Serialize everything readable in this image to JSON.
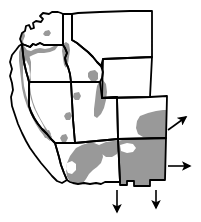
{
  "figure": {
    "type": "distribution-range-map",
    "region": "Western United States",
    "title": "",
    "background_color": "#ffffff",
    "outline_color": "#000000",
    "range_fill_color": "#999999",
    "state_fill_color": "#ffffff",
    "arrow_color": "#000000",
    "arrow_meaning": "range continues beyond map edge"
  },
  "map": {
    "states": [
      {
        "name": "Washington",
        "abbr": "WA",
        "path": "M 20 39 L 22 33 L 25 31 L 26 26 L 29 25 L 31 29 L 34 28 L 33 23 L 36 21 L 41 22 L 43 19 L 40 16 L 43 13 L 49 14 L 52 12 L 58 12 L 61 13 L 63 14 L 63 45 L 44 45 L 40 43 L 36 45 L 33 44 L 30 47 L 25 45 L 22 44 Z"
      },
      {
        "name": "Oregon",
        "abbr": "OR",
        "path": "M 22 44 L 25 45 L 30 47 L 33 44 L 36 45 L 40 43 L 44 45 L 63 45 L 65 48 L 67 53 L 65 58 L 66 63 L 68 67 L 70 74 L 71 82 L 29 82 L 28 78 L 26 71 L 24 62 L 23 54 Z"
      },
      {
        "name": "Idaho",
        "abbr": "ID",
        "path": "M 63 14 L 72 14 L 72 40 L 77 43 L 83 48 L 88 52 L 93 57 L 97 62 L 101 66 L 103 72 L 102 78 L 100 82 L 71 82 L 70 74 L 68 67 L 66 63 L 65 58 L 67 53 L 65 48 L 63 45 Z"
      },
      {
        "name": "Montana",
        "abbr": "MT",
        "path": "M 72 14 L 78 13 L 100 12 L 130 11 L 152 11 L 152 57 L 103 59 L 101 66 L 97 62 L 93 57 L 88 52 L 83 48 L 77 43 L 72 40 Z"
      },
      {
        "name": "Wyoming",
        "abbr": "WY",
        "path": "M 103 59 L 152 57 L 150 97 L 102 98 Z"
      },
      {
        "name": "Nevada",
        "abbr": "NV",
        "path": "M 29 82 L 71 82 L 73 119 L 75 143 L 55 143 L 51 139 L 47 134 L 42 129 L 38 124 L 34 118 L 31 112 L 29 106 Z"
      },
      {
        "name": "Utah",
        "abbr": "UT",
        "path": "M 71 82 L 100 82 L 102 98 L 117 97 L 118 139 L 75 143 L 73 119 Z"
      },
      {
        "name": "Colorado",
        "abbr": "CO",
        "path": "M 102 98 L 150 97 L 167 96 L 166 138 L 118 139 L 117 97 Z"
      },
      {
        "name": "California",
        "abbr": "CA",
        "path": "M 22 44 L 23 54 L 24 62 L 26 71 L 28 78 L 29 82 L 29 106 L 31 112 L 34 118 L 38 124 L 42 129 L 47 134 L 51 139 L 55 143 L 57 150 L 59 157 L 61 165 L 64 173 L 67 180 L 62 183 L 57 181 L 52 176 L 47 170 L 41 163 L 35 155 L 30 148 L 26 141 L 22 133 L 18 124 L 15 115 L 12 106 L 11 97 L 13 90 L 12 83 L 10 76 L 12 69 L 10 62 L 12 55 L 16 50 L 19 46 Z"
      },
      {
        "name": "Arizona",
        "abbr": "AZ",
        "path": "M 75 143 L 118 139 L 120 182 L 105 182 L 101 184 L 96 183 L 90 184 L 84 183 L 78 184 L 73 183 L 70 182 L 67 180 L 64 173 L 61 165 L 59 157 L 57 150 L 55 143 Z"
      },
      {
        "name": "New Mexico",
        "abbr": "NM",
        "path": "M 118 139 L 166 138 L 165 180 L 150 180 L 150 186 L 134 186 L 134 181 L 127 181 L 127 185 L 120 185 L 120 182 Z"
      }
    ],
    "range_polygons": [
      {
        "label": "washington-coast-range",
        "path": "M 20 39 L 22 34 L 24 32 L 25 36 L 23 41 L 24 46 L 27 50 L 31 51 L 35 49 L 40 48 L 45 49 L 50 48 L 54 46 L 57 44 L 58 46 L 55 50 L 50 52 L 44 53 L 38 53 L 33 55 L 29 57 L 26 55 L 23 51 L 21 46 Z"
      },
      {
        "label": "washington-cascade-spot",
        "path": "M 45 31 L 49 30 L 51 33 L 49 36 L 45 36 L 43 34 Z"
      },
      {
        "label": "oregon-coast-cascade-range",
        "path": "M 23 53 L 26 55 L 29 57 L 30 62 L 29 68 L 30 74 L 31 80 L 30 86 L 28 92 L 27 98 L 25 95 L 24 88 L 23 80 L 23 72 L 22 64 Z"
      },
      {
        "label": "idaho-panhandle-range",
        "path": "M 63 44 L 66 42 L 69 44 L 70 50 L 69 57 L 68 64 L 66 68 L 64 65 L 63 58 L 62 51 Z"
      },
      {
        "label": "idaho-southeast-spot",
        "path": "M 90 71 L 95 70 L 98 73 L 98 79 L 95 82 L 91 81 L 88 77 L 88 73 Z"
      },
      {
        "label": "utah-wasatch-range",
        "path": "M 99 82 L 103 80 L 106 84 L 107 92 L 106 100 L 104 108 L 101 114 L 97 118 L 94 116 L 94 109 L 95 101 L 96 92 L 97 86 Z"
      },
      {
        "label": "nevada-spot-north",
        "path": "M 74 93 L 79 92 L 81 96 L 79 100 L 75 100 L 73 97 Z"
      },
      {
        "label": "nevada-spot-central",
        "path": "M 66 113 L 70 112 L 72 116 L 70 120 L 66 120 L 64 116 Z"
      },
      {
        "label": "nevada-spot-south",
        "path": "M 62 135 L 66 134 L 68 138 L 66 142 L 62 142 L 60 138 Z"
      },
      {
        "label": "california-spot-sierra-south",
        "path": "M 45 131 L 49 130 L 51 134 L 49 138 L 45 138 L 43 134 Z"
      },
      {
        "label": "california-coast-sierra-range",
        "path": "M 21 46 L 25 49 L 29 55 L 31 62 L 31 70 L 30 78 L 30 86 L 31 94 L 33 102 L 36 110 L 40 118 L 44 125 L 48 131 L 52 137 L 50 141 L 45 137 L 40 131 L 35 123 L 31 115 L 27 106 L 24 97 L 22 88 L 21 79 L 20 70 L 19 61 L 19 52 Z"
      },
      {
        "label": "california-central-valley-gap",
        "path": "M 26 60 L 29 66 L 30 74 L 29 82 L 29 90 L 31 99 L 34 108 L 38 116 L 42 123 L 45 129 L 42 128 L 37 121 L 33 113 L 29 104 L 26 95 L 24 86 L 23 76 L 23 67 Z",
        "fill": "#ffffff"
      },
      {
        "label": "arizona-mogollon-rim-range",
        "path": "M 76 148 L 82 145 L 88 143 L 94 143 L 99 145 L 102 150 L 103 157 L 101 163 L 97 167 L 93 170 L 89 174 L 86 179 L 83 183 L 78 184 L 73 183 L 70 181 L 67 177 L 66 170 L 67 163 L 70 156 Z"
      },
      {
        "label": "arizona-north-rim-extension",
        "path": "M 99 145 L 106 142 L 113 141 L 118 141 L 119 148 L 117 154 L 112 157 L 106 157 L 102 154 L 100 150 Z"
      },
      {
        "label": "new-mexico-main-range",
        "path": "M 118 141 L 126 139 L 134 139 L 142 139 L 150 139 L 157 138 L 163 138 L 166 138 L 165 180 L 150 180 L 150 186 L 134 186 L 134 181 L 127 181 L 127 185 L 120 185 L 120 182 L 119 172 L 119 160 L 119 150 Z"
      },
      {
        "label": "new-mexico-white-notch-upper",
        "path": "M 120 145 L 127 143 L 133 144 L 136 148 L 133 152 L 127 153 L 121 151 Z",
        "fill": "#ffffff"
      },
      {
        "label": "colorado-southwest-range",
        "path": "M 140 116 L 148 113 L 156 111 L 163 110 L 167 110 L 167 138 L 158 138 L 150 138 L 143 137 L 138 134 L 136 128 L 137 121 Z"
      },
      {
        "label": "arizona-southwest-notch",
        "path": "M 67 163 L 72 161 L 76 164 L 76 170 L 72 174 L 68 173 L 66 169 Z",
        "fill": "#ffffff"
      }
    ],
    "arrows": [
      {
        "name": "arrow-northeast",
        "direction": "northeast",
        "from_x": 168,
        "from_y": 130,
        "to_x": 186,
        "to_y": 117
      },
      {
        "name": "arrow-east",
        "direction": "east",
        "from_x": 168,
        "from_y": 166,
        "to_x": 190,
        "to_y": 166
      },
      {
        "name": "arrow-south-left",
        "direction": "south",
        "from_x": 117,
        "from_y": 190,
        "to_x": 117,
        "to_y": 212
      },
      {
        "name": "arrow-south-right",
        "direction": "south",
        "from_x": 156,
        "from_y": 190,
        "to_x": 156,
        "to_y": 208
      }
    ]
  }
}
